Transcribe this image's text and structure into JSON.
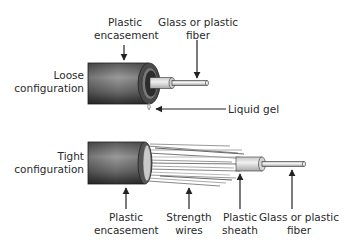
{
  "diagram": {
    "type": "fiber-optic cable construction",
    "loose": {
      "label_line1": "Loose",
      "label_line2": "configuration",
      "callouts": {
        "encasement_line1": "Plastic",
        "encasement_line2": "encasement",
        "fiber_line1": "Glass or plastic",
        "fiber_line2": "fiber",
        "gel": "Liquid gel"
      }
    },
    "tight": {
      "label_line1": "Tight",
      "label_line2": "configuration",
      "callouts": {
        "encasement_line1": "Plastic",
        "encasement_line2": "encasement",
        "wires_line1": "Strength",
        "wires_line2": "wires",
        "sheath_line1": "Plastic",
        "sheath_line2": "sheath",
        "fiber_line1": "Glass or plastic",
        "fiber_line2": "fiber"
      }
    },
    "colors": {
      "encasement_dark": "#3a3a3a",
      "encasement_light": "#8a8a8a",
      "fiber": "#e6e6e6",
      "outline": "#222222"
    }
  }
}
